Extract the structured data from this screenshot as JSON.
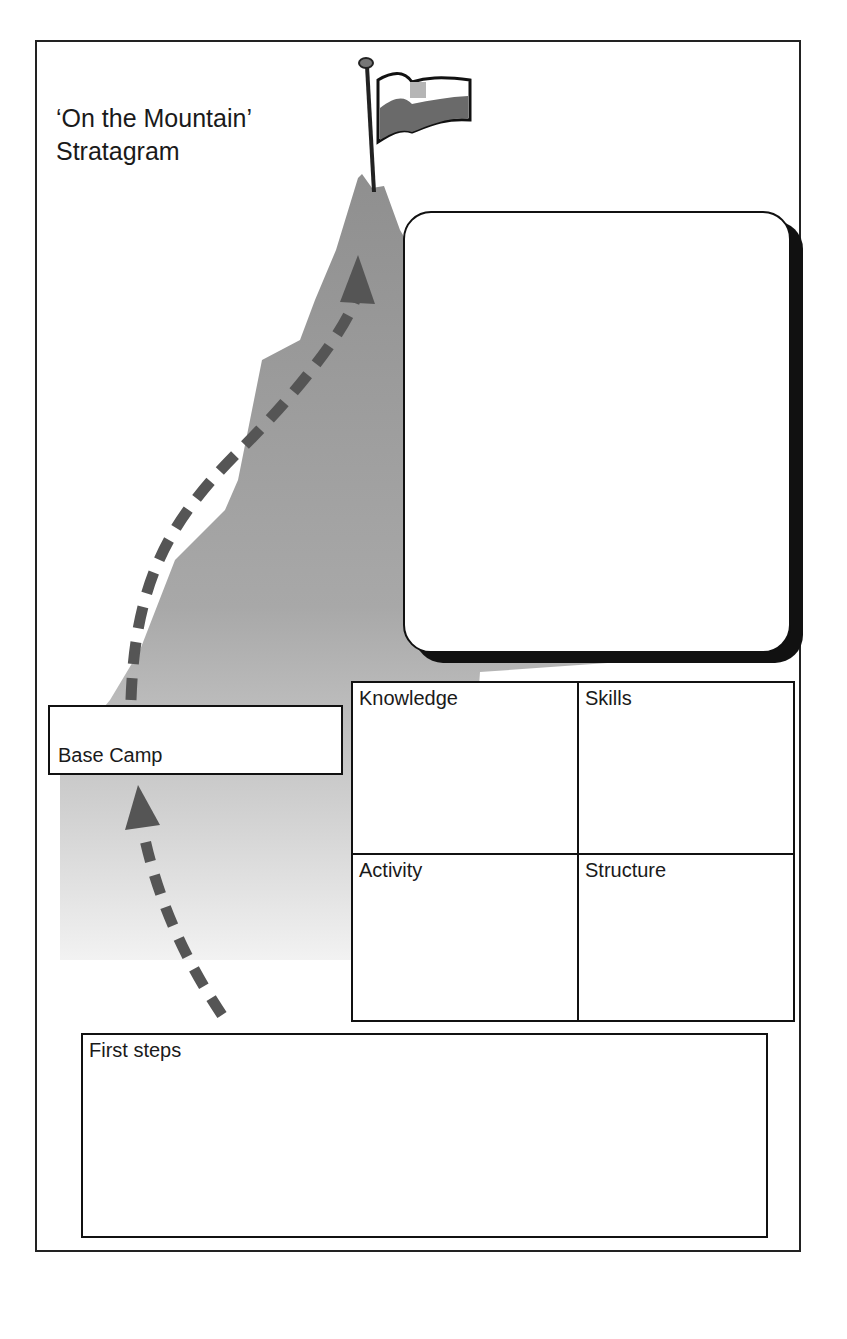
{
  "title": {
    "line1": "‘On the Mountain’",
    "line2": "Stratagram"
  },
  "icons": {
    "flag": "flag-icon",
    "mountain": "mountain-illustration",
    "path_arrow_upper": "dashed-arrow-up-icon",
    "path_arrow_lower": "dashed-arrow-up-icon"
  },
  "boxes": {
    "summit_goal": {
      "label": ""
    },
    "base_camp": {
      "label": "Base Camp"
    },
    "quadrants": [
      {
        "label": "Knowledge"
      },
      {
        "label": "Skills"
      },
      {
        "label": "Activity"
      },
      {
        "label": "Structure"
      }
    ],
    "first_steps": {
      "label": "First steps"
    }
  },
  "colors": {
    "mountain": "#9a9a9a",
    "mountain_light": "#dcdcdc",
    "arrow": "#505050",
    "border": "#111111"
  }
}
